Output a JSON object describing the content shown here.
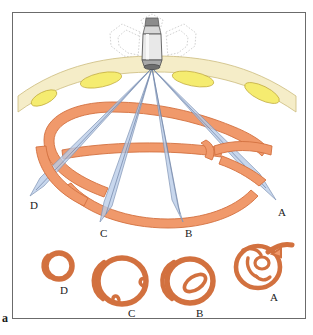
{
  "figure": {
    "panel_label": "a",
    "caption_present": false
  },
  "colors": {
    "vessel_fill": "#F0996B",
    "vessel_stroke": "#D2713F",
    "beam_fill": "#B8CCE8",
    "beam_stroke": "#7F93B5",
    "fat_band_fill": "#F5EDC8",
    "fat_band_stroke": "#CBBB7E",
    "fat_lobule_fill": "#F5EC70",
    "fat_lobule_stroke": "#BFA93C",
    "probe_body": "#E8E8E8",
    "probe_stroke": "#5A5A5A",
    "probe_cap": "#8C8C8C",
    "ghost_stroke": "#BFBFBF",
    "border": "#6B6B6B",
    "text": "#1A1A1A",
    "background": "#FFFFFF"
  },
  "probe": {
    "name": "ultrasound-transducer",
    "apex": {
      "x": 152,
      "y": 68
    },
    "ghost_outlines": 2
  },
  "fat_layer": {
    "name": "subcutaneous-fat-band",
    "lobules": 4
  },
  "scan_planes": [
    {
      "id": "D",
      "label": "D",
      "label_x": 33,
      "label_y": 200,
      "tip_x": 30,
      "tip_y": 196
    },
    {
      "id": "C",
      "label": "C",
      "label_x": 103,
      "label_y": 228,
      "tip_x": 100,
      "tip_y": 222
    },
    {
      "id": "B",
      "label": "B",
      "label_x": 188,
      "label_y": 228,
      "tip_x": 183,
      "tip_y": 222
    },
    {
      "id": "A",
      "label": "A",
      "label_x": 281,
      "label_y": 207,
      "tip_x": 276,
      "tip_y": 200
    }
  ],
  "cross_sections": [
    {
      "id": "D",
      "label": "D",
      "label_x": 63,
      "label_y": 290,
      "cx": 57,
      "cy": 265,
      "rx": 21,
      "ry": 21,
      "description": "small thick ring with overlapping crescent"
    },
    {
      "id": "C",
      "label": "C",
      "label_x": 131,
      "label_y": 312,
      "cx": 122,
      "cy": 281,
      "rx": 29,
      "ry": 28,
      "description": "large ring with notches at right and lower-left"
    },
    {
      "id": "B",
      "label": "B",
      "label_x": 198,
      "label_y": 312,
      "cx": 190,
      "cy": 281,
      "rx": 28,
      "ry": 27,
      "description": "ring with elliptical lumen inside"
    },
    {
      "id": "A",
      "label": "A",
      "label_x": 272,
      "label_y": 296,
      "cx": 259,
      "cy": 267,
      "rx": 26,
      "ry": 25,
      "description": "complex ring with branching internal vessels and entering branch"
    }
  ]
}
